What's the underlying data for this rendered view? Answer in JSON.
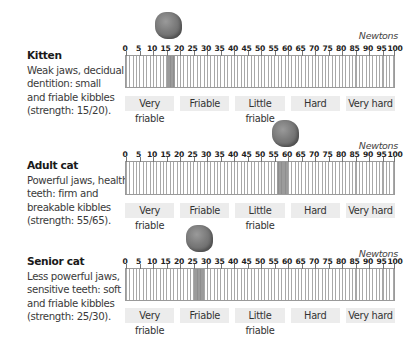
{
  "units_label": "Newtons",
  "scale": {
    "min": 0,
    "max": 100,
    "tick_labels": [
      "0",
      "5",
      "10",
      "15",
      "20",
      "25",
      "30",
      "35",
      "40",
      "45",
      "50",
      "55",
      "60",
      "65",
      "70",
      "75",
      "80",
      "85",
      "90",
      "95",
      "100"
    ]
  },
  "categories": [
    "Very friable",
    "Friable",
    "Little friable",
    "Hard",
    "Very hard"
  ],
  "panels": [
    {
      "title": "Kitten",
      "lines": [
        "Weak jaws, decidual",
        "dentition: small",
        "and friable kibbles",
        "(strength: 15/20)."
      ],
      "range": [
        15,
        18
      ]
    },
    {
      "title": "Adult cat",
      "lines": [
        "Powerful jaws, healthy",
        "teeth: firm and",
        "breakable kibbles",
        "(strength: 55/65)."
      ],
      "range": [
        56,
        60
      ]
    },
    {
      "title": "Senior cat",
      "lines": [
        "Less powerful jaws,",
        "sensitive teeth: soft",
        "and friable kibbles",
        "(strength: 25/30)."
      ],
      "range": [
        25,
        29
      ]
    }
  ],
  "chart_data": {
    "type": "bar",
    "xlabel": "Newtons",
    "xlim": [
      0,
      100
    ],
    "x_ticks": [
      0,
      5,
      10,
      15,
      20,
      25,
      30,
      35,
      40,
      45,
      50,
      55,
      60,
      65,
      70,
      75,
      80,
      85,
      90,
      95,
      100
    ],
    "bands": [
      "Very friable",
      "Friable",
      "Little friable",
      "Hard",
      "Very hard"
    ],
    "series": [
      {
        "name": "Kitten",
        "stated_strength": "15/20",
        "highlight_range": [
          15,
          18
        ]
      },
      {
        "name": "Adult cat",
        "stated_strength": "55/65",
        "highlight_range": [
          56,
          60
        ]
      },
      {
        "name": "Senior cat",
        "stated_strength": "25/30",
        "highlight_range": [
          25,
          29
        ]
      }
    ]
  }
}
